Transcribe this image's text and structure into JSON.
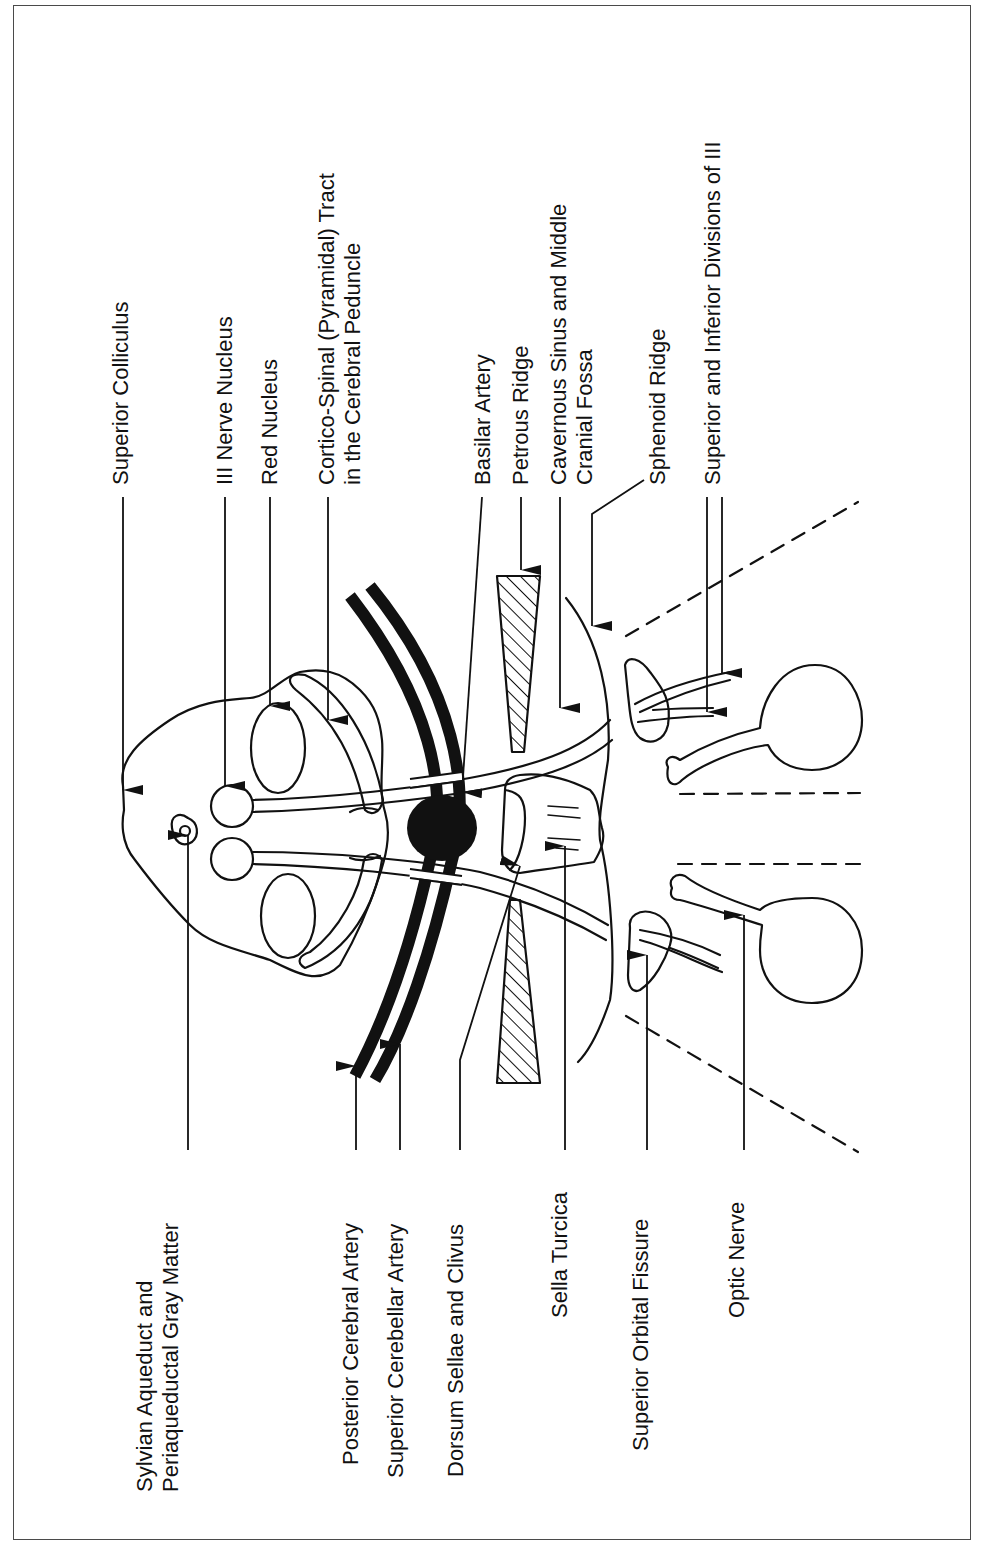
{
  "figure": {
    "stroke_color": "#111111",
    "frame_color": "#4a4a4a",
    "top_labels": [
      {
        "id": "superior-colliculus",
        "lines": [
          "Superior Colliculus"
        ],
        "x": 108,
        "y": 485
      },
      {
        "id": "iii-nerve-nucleus",
        "lines": [
          "III Nerve Nucleus"
        ],
        "x": 212,
        "y": 485
      },
      {
        "id": "red-nucleus",
        "lines": [
          "Red Nucleus"
        ],
        "x": 257,
        "y": 485
      },
      {
        "id": "cortico-spinal-tract",
        "lines": [
          "Cortico-Spinal (Pyramidal) Tract",
          "in the Cerebral Peduncle"
        ],
        "x": 314,
        "y": 485
      },
      {
        "id": "basilar-artery",
        "lines": [
          "Basilar Artery"
        ],
        "x": 470,
        "y": 485
      },
      {
        "id": "petrous-ridge",
        "lines": [
          "Petrous Ridge"
        ],
        "x": 508,
        "y": 485
      },
      {
        "id": "cavernous-sinus",
        "lines": [
          "Cavernous Sinus and Middle",
          "Cranial Fossa"
        ],
        "x": 546,
        "y": 485
      },
      {
        "id": "sphenoid-ridge",
        "lines": [
          "Sphenoid Ridge"
        ],
        "x": 645,
        "y": 485
      },
      {
        "id": "superior-inferior-divisions-iii",
        "lines": [
          "Superior and Inferior Divisions of III"
        ],
        "x": 700,
        "y": 485
      }
    ],
    "bottom_labels": [
      {
        "id": "sylvian-aqueduct",
        "lines": [
          "Sylvian Aqueduct and",
          "Periaqueductal Gray Matter"
        ],
        "x": 132,
        "y": 1492
      },
      {
        "id": "posterior-cerebral-artery",
        "lines": [
          "Posterior Cerebral Artery"
        ],
        "x": 338,
        "y": 1465
      },
      {
        "id": "superior-cerebellar-artery",
        "lines": [
          "Superior Cerebellar Artery"
        ],
        "x": 383,
        "y": 1478
      },
      {
        "id": "dorsum-sellae-clivus",
        "lines": [
          "Dorsum Sellae and Clivus"
        ],
        "x": 443,
        "y": 1477
      },
      {
        "id": "sella-turcica",
        "lines": [
          "Sella Turcica"
        ],
        "x": 547,
        "y": 1318
      },
      {
        "id": "superior-orbital-fissure",
        "lines": [
          "Superior Orbital Fissure"
        ],
        "x": 628,
        "y": 1451
      },
      {
        "id": "optic-nerve",
        "lines": [
          "Optic Nerve"
        ],
        "x": 724,
        "y": 1318
      }
    ]
  }
}
